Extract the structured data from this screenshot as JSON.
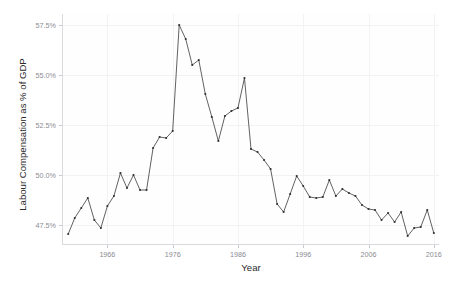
{
  "chart_data": {
    "type": "line",
    "title": "",
    "xlabel": "Year",
    "ylabel": "Labour Compensation as % of GDP",
    "xlim": [
      1959.2,
      2016.8
    ],
    "ylim": [
      46.55,
      58.05
    ],
    "grid": true,
    "legend": "none",
    "x_ticks": [
      1966,
      1976,
      1986,
      1996,
      2006,
      2016
    ],
    "x_tick_labels": [
      "1966",
      "1976",
      "1986",
      "1996",
      "2006",
      "2016"
    ],
    "y_ticks": [
      47.5,
      50.0,
      52.5,
      55.0,
      57.5
    ],
    "y_tick_labels": [
      "47.5%",
      "50.0%",
      "52.5%",
      "55.0%",
      "57.5%"
    ],
    "line_color": "#3a3a3a",
    "point_color": "#2e2e2e",
    "background_color": "#ffffff",
    "grid_color": "#f3f3f6",
    "x": [
      1960,
      1961,
      1962,
      1963,
      1964,
      1965,
      1966,
      1967,
      1968,
      1969,
      1970,
      1971,
      1972,
      1973,
      1974,
      1975,
      1976,
      1977,
      1978,
      1979,
      1980,
      1981,
      1982,
      1983,
      1984,
      1985,
      1986,
      1987,
      1988,
      1989,
      1990,
      1991,
      1992,
      1993,
      1994,
      1995,
      1996,
      1997,
      1998,
      1999,
      2000,
      2001,
      2002,
      2003,
      2004,
      2005,
      2006,
      2007,
      2008,
      2009,
      2010,
      2011,
      2012,
      2013,
      2014,
      2015,
      2016
    ],
    "y": [
      47.05,
      47.85,
      48.35,
      48.85,
      47.75,
      47.35,
      48.45,
      48.95,
      50.1,
      49.35,
      50.0,
      49.25,
      49.25,
      51.35,
      51.9,
      51.85,
      52.2,
      57.5,
      56.8,
      55.5,
      55.75,
      54.05,
      52.9,
      51.7,
      52.95,
      53.2,
      53.35,
      54.85,
      51.3,
      51.15,
      50.75,
      50.3,
      48.55,
      48.15,
      49.05,
      49.95,
      49.45,
      48.9,
      48.85,
      48.9,
      49.75,
      48.95,
      49.3,
      49.1,
      48.95,
      48.5,
      48.3,
      48.25,
      47.75,
      48.1,
      47.65,
      48.15,
      46.95,
      47.35,
      47.4,
      48.25,
      47.95,
      48.35,
      48.7,
      47.1
    ],
    "series": [
      {
        "name": "Labour Compensation as % of GDP",
        "points": [
          [
            1960,
            47.05
          ],
          [
            1961,
            47.85
          ],
          [
            1962,
            48.35
          ],
          [
            1963,
            48.85
          ],
          [
            1964,
            47.75
          ],
          [
            1965,
            47.35
          ],
          [
            1966,
            48.45
          ],
          [
            1967,
            48.95
          ],
          [
            1968,
            50.1
          ],
          [
            1969,
            49.35
          ],
          [
            1970,
            50.0
          ],
          [
            1971,
            49.25
          ],
          [
            1972,
            49.25
          ],
          [
            1973,
            51.35
          ],
          [
            1974,
            51.9
          ],
          [
            1975,
            51.85
          ],
          [
            1976,
            52.2
          ],
          [
            1977,
            57.5
          ],
          [
            1978,
            56.8
          ],
          [
            1979,
            55.5
          ],
          [
            1980,
            55.75
          ],
          [
            1981,
            54.05
          ],
          [
            1982,
            52.9
          ],
          [
            1983,
            51.7
          ],
          [
            1984,
            52.95
          ],
          [
            1985,
            53.2
          ],
          [
            1986,
            53.35
          ],
          [
            1987,
            54.85
          ],
          [
            1988,
            51.3
          ],
          [
            1989,
            51.15
          ],
          [
            1990,
            50.75
          ],
          [
            1991,
            50.3
          ],
          [
            1992,
            48.55
          ],
          [
            1993,
            48.15
          ],
          [
            1994,
            49.05
          ],
          [
            1995,
            49.95
          ],
          [
            1996,
            49.45
          ],
          [
            1997,
            48.9
          ],
          [
            1998,
            48.85
          ],
          [
            1999,
            48.9
          ],
          [
            2000,
            49.75
          ],
          [
            2001,
            48.95
          ],
          [
            2002,
            49.3
          ],
          [
            2003,
            49.1
          ],
          [
            2004,
            48.95
          ],
          [
            2005,
            48.5
          ],
          [
            2006,
            48.3
          ],
          [
            2007,
            48.25
          ],
          [
            2008,
            47.75
          ],
          [
            2009,
            48.1
          ],
          [
            2010,
            47.65
          ],
          [
            2011,
            48.15
          ],
          [
            2012,
            46.95
          ],
          [
            2013,
            47.35
          ],
          [
            2014,
            47.4
          ],
          [
            2015,
            48.25
          ],
          [
            2016,
            47.1
          ]
        ]
      }
    ]
  }
}
